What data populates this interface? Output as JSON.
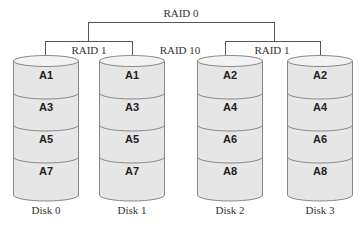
{
  "title": "RAID 10",
  "raid0_label": "RAID 0",
  "raid1_left_label": "RAID 1",
  "raid1_right_label": "RAID 1",
  "raid10_label": "RAID 10",
  "disks": [
    {
      "name": "Disk 0",
      "blocks": [
        "A1",
        "A3",
        "A5",
        "A7"
      ]
    },
    {
      "name": "Disk 1",
      "blocks": [
        "A1",
        "A3",
        "A5",
        "A7"
      ]
    },
    {
      "name": "Disk 2",
      "blocks": [
        "A2",
        "A4",
        "A6",
        "A8"
      ]
    },
    {
      "name": "Disk 3",
      "blocks": [
        "A2",
        "A4",
        "A6",
        "A8"
      ]
    }
  ],
  "colors": {
    "disk_fill": "#e8e8e8",
    "disk_stroke": "#888888",
    "line": "#555555"
  }
}
